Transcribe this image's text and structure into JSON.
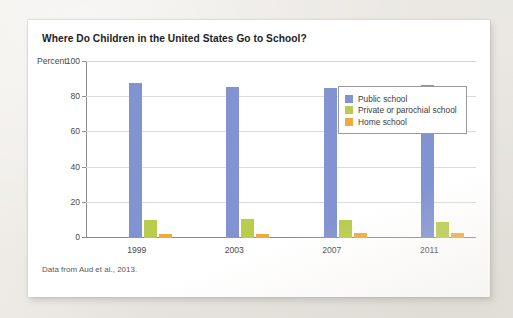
{
  "figure": {
    "title": "Where Do Children in the United States Go to School?",
    "source_note": "Data from Aud et al., 2013."
  },
  "colors": {
    "public": "#8193d1",
    "private": "#b9cc4c",
    "home": "#f2a93b",
    "card": "#ffffff",
    "page": "#edeae5",
    "axis": "#8d8d8d",
    "grid": "#dcdcdc"
  },
  "chart_data": {
    "type": "bar",
    "title": "Where Do Children in the United States Go to School?",
    "xlabel": "",
    "ylabel": "Percent",
    "ylim": [
      0,
      100
    ],
    "yticks": [
      0,
      20,
      40,
      60,
      80,
      100
    ],
    "grid": true,
    "legend_position": "top-right",
    "categories": [
      "1999",
      "2003",
      "2007",
      "2011"
    ],
    "series": [
      {
        "name": "Public school",
        "color": "#8193d1",
        "values": [
          88,
          86,
          85,
          87
        ]
      },
      {
        "name": "Private or parochial school",
        "color": "#b9cc4c",
        "values": [
          10,
          11,
          10,
          9
        ]
      },
      {
        "name": "Home school",
        "color": "#f2a93b",
        "values": [
          2,
          2.5,
          3,
          3
        ]
      }
    ],
    "annotations": [
      "Data from Aud et al., 2013."
    ]
  }
}
